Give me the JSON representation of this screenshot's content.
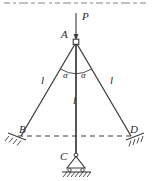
{
  "figure": {
    "caption_fragment": "",
    "type": "statics-truss-diagram",
    "colors": {
      "line": "#3a3a3a",
      "text": "#2b2b2b",
      "background": "#ffffff",
      "hatch": "#3a3a3a"
    }
  },
  "labels": {
    "load": "P",
    "apex": "A",
    "left_support": "B",
    "bottom_support": "C",
    "right_support": "D",
    "angle_left": "α",
    "angle_right": "α",
    "member_left_length": "l",
    "member_center_length": "l",
    "member_right_length": "l"
  },
  "geometry": {
    "apex": {
      "x": 76,
      "y": 41
    },
    "left_node": {
      "x": 21,
      "y": 136
    },
    "right_node": {
      "x": 131,
      "y": 136
    },
    "bottom_node": {
      "x": 76,
      "y": 155
    },
    "load_arrow_top": {
      "x": 76,
      "y": 13
    },
    "dashed_line_y": 136
  },
  "elements": {
    "members": [
      {
        "name": "member-A-B",
        "from": "A",
        "to": "B",
        "length_label": "l"
      },
      {
        "name": "member-A-C",
        "from": "A",
        "to": "C",
        "length_label": "l"
      },
      {
        "name": "member-A-D",
        "from": "A",
        "to": "D",
        "length_label": "l"
      }
    ],
    "supports": [
      {
        "name": "support-B",
        "label": "B",
        "kind": "hatched-fixed"
      },
      {
        "name": "support-D",
        "label": "D",
        "kind": "hatched-fixed"
      },
      {
        "name": "support-C",
        "label": "C",
        "kind": "pin-roller-on-ground"
      }
    ],
    "loads": [
      {
        "name": "load-P",
        "label": "P",
        "direction": "downward",
        "applied_at": "A"
      }
    ],
    "angles": [
      {
        "name": "angle-left-alpha",
        "label": "α",
        "between": [
          "A-C",
          "A-B"
        ]
      },
      {
        "name": "angle-right-alpha",
        "label": "α",
        "between": [
          "A-C",
          "A-D"
        ]
      }
    ],
    "guides": [
      {
        "name": "dashed-baseline",
        "style": "dashed",
        "from": "B",
        "to": "D"
      }
    ]
  }
}
